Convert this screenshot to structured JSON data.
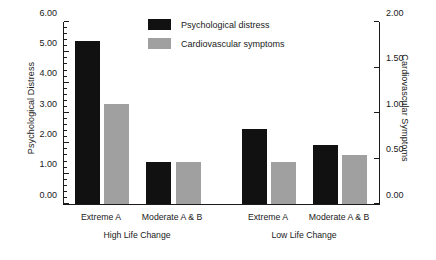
{
  "chart_data": {
    "type": "bar",
    "title": "",
    "categories": [
      "Extreme A",
      "Moderate A & B",
      "Extreme A",
      "Moderate A & B"
    ],
    "groups": [
      {
        "label": "High Life Change",
        "categories": [
          "Extreme A",
          "Moderate A & B"
        ]
      },
      {
        "label": "Low Life Change",
        "categories": [
          "Extreme A",
          "Moderate A & B"
        ]
      }
    ],
    "series": [
      {
        "name": "Psychological distress",
        "axis": "left",
        "color": "#111111",
        "values": [
          5.38,
          1.4,
          2.48,
          1.95
        ]
      },
      {
        "name": "Cardiovascular symptoms",
        "axis": "right",
        "color": "#a0a0a0",
        "values": [
          1.1,
          0.46,
          0.46,
          0.54
        ]
      }
    ],
    "xlabel": "",
    "ylabel": "Psychological Distress",
    "y2label": "Cardiovascular Symptoms",
    "ylim": [
      0,
      6
    ],
    "y2lim": [
      0,
      2
    ],
    "ytick_step": 1,
    "y2tick_step": 0.5,
    "yminor_step": 0.2,
    "ytick_labels": [
      "0.00",
      "1.00",
      "2.00",
      "3.00",
      "4.00",
      "5.00",
      "6.00"
    ],
    "y2tick_labels": [
      "0.00",
      "0.50",
      "1.00",
      "1.50",
      "2.00"
    ],
    "grid": false,
    "legend_position": "top-center"
  },
  "axes": {
    "left": {
      "title": "Psychological Distress",
      "ticks": [
        {
          "value": 0,
          "label": "0.00"
        },
        {
          "value": 1,
          "label": "1.00"
        },
        {
          "value": 2,
          "label": "2.00"
        },
        {
          "value": 3,
          "label": "3.00"
        },
        {
          "value": 4,
          "label": "4.00"
        },
        {
          "value": 5,
          "label": "5.00"
        },
        {
          "value": 6,
          "label": "6.00"
        }
      ]
    },
    "right": {
      "title": "Cardiovascular Symptoms",
      "ticks": [
        {
          "value": 0.0,
          "label": "0.00"
        },
        {
          "value": 0.5,
          "label": "0.50"
        },
        {
          "value": 1.0,
          "label": "1.00"
        },
        {
          "value": 1.5,
          "label": "1.50"
        },
        {
          "value": 2.0,
          "label": "2.00"
        }
      ]
    }
  },
  "legend": {
    "items": [
      {
        "label": "Psychological distress",
        "color": "#111111"
      },
      {
        "label": "Cardiovascular symptoms",
        "color": "#a0a0a0"
      }
    ]
  },
  "colors": {
    "psychological_distress": "#111111",
    "cardiovascular_symptoms": "#a0a0a0",
    "axis": "#1a1a1a",
    "background": "#ffffff"
  },
  "geometry": {
    "plot_left": 63,
    "plot_top": 22,
    "plot_width": 315,
    "plot_height": 182,
    "bar_width": 25,
    "bars": [
      {
        "series": 0,
        "category": 0,
        "x": 74
      },
      {
        "series": 1,
        "category": 0,
        "x": 103
      },
      {
        "series": 0,
        "category": 1,
        "x": 145
      },
      {
        "series": 1,
        "category": 1,
        "x": 175
      },
      {
        "series": 0,
        "category": 2,
        "x": 241
      },
      {
        "series": 1,
        "category": 2,
        "x": 270
      },
      {
        "series": 0,
        "category": 3,
        "x": 312
      },
      {
        "series": 1,
        "category": 3,
        "x": 341
      }
    ],
    "cat_label_centers": [
      101,
      172,
      268,
      339
    ],
    "group_label_centers": [
      137,
      304
    ]
  }
}
